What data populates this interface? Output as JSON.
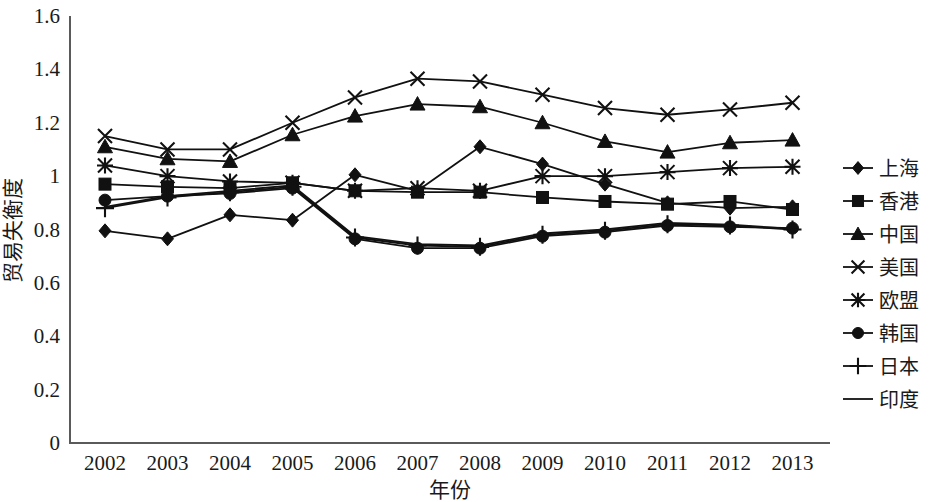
{
  "chart_data": {
    "type": "line",
    "title": "",
    "xlabel": "年份",
    "ylabel": "贸易失衡度",
    "x": [
      "2002",
      "2003",
      "2004",
      "2005",
      "2006",
      "2007",
      "2008",
      "2009",
      "2010",
      "2011",
      "2012",
      "2013"
    ],
    "categories": [
      "2002",
      "2003",
      "2004",
      "2005",
      "2006",
      "2007",
      "2008",
      "2009",
      "2010",
      "2011",
      "2012",
      "2013"
    ],
    "ylim": [
      0,
      1.6
    ],
    "ytick_labels": [
      "0",
      "0.2",
      "0.4",
      "0.6",
      "0.8",
      "1",
      "1.2",
      "1.4",
      "1.6"
    ],
    "yticks": [
      0,
      0.2,
      0.4,
      0.6,
      0.8,
      1,
      1.2,
      1.4,
      1.6
    ],
    "grid": false,
    "legend_position": "right",
    "series": [
      {
        "name": "上海",
        "marker": "diamond",
        "values": [
          0.795,
          0.765,
          0.855,
          0.835,
          1.005,
          0.945,
          1.11,
          1.045,
          0.97,
          0.9,
          0.88,
          0.885
        ]
      },
      {
        "name": "香港",
        "marker": "square",
        "values": [
          0.97,
          0.96,
          0.955,
          0.975,
          0.945,
          0.94,
          0.94,
          0.92,
          0.905,
          0.895,
          0.905,
          0.875
        ]
      },
      {
        "name": "中国",
        "marker": "triangle",
        "values": [
          1.11,
          1.065,
          1.055,
          1.155,
          1.225,
          1.27,
          1.26,
          1.2,
          1.13,
          1.09,
          1.125,
          1.135
        ]
      },
      {
        "name": "美国",
        "marker": "cross-x",
        "values": [
          1.15,
          1.1,
          1.1,
          1.2,
          1.295,
          1.365,
          1.355,
          1.305,
          1.255,
          1.23,
          1.25,
          1.275
        ]
      },
      {
        "name": "欧盟",
        "marker": "asterisk",
        "values": [
          1.04,
          1.0,
          0.98,
          0.975,
          0.945,
          0.955,
          0.945,
          1.0,
          1.0,
          1.015,
          1.03,
          1.035
        ]
      },
      {
        "name": "韩国",
        "marker": "circle",
        "values": [
          0.91,
          0.925,
          0.935,
          0.955,
          0.765,
          0.73,
          0.73,
          0.775,
          0.79,
          0.815,
          0.81,
          0.805
        ]
      },
      {
        "name": "日本",
        "marker": "plus",
        "values": [
          0.88,
          0.92,
          0.94,
          0.96,
          0.77,
          0.74,
          0.735,
          0.78,
          0.795,
          0.82,
          0.815,
          0.8
        ]
      },
      {
        "name": "印度",
        "marker": "line",
        "values": [
          0.885,
          0.925,
          0.945,
          0.965,
          0.775,
          0.745,
          0.74,
          0.785,
          0.8,
          0.825,
          0.818,
          0.802
        ]
      }
    ]
  },
  "legend": {
    "items": [
      {
        "label": "上海",
        "marker": "diamond"
      },
      {
        "label": "香港",
        "marker": "square"
      },
      {
        "label": "中国",
        "marker": "triangle"
      },
      {
        "label": "美国",
        "marker": "cross-x"
      },
      {
        "label": "欧盟",
        "marker": "asterisk"
      },
      {
        "label": "韩国",
        "marker": "circle"
      },
      {
        "label": "日本",
        "marker": "plus"
      },
      {
        "label": "印度",
        "marker": "line"
      }
    ]
  }
}
